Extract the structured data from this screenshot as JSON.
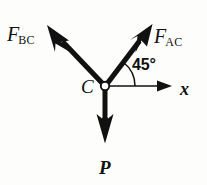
{
  "figure": {
    "type": "free-body-diagram",
    "background_color": "#fdfdfb",
    "stroke_color": "#111111",
    "width": 207,
    "height": 185
  },
  "node": {
    "label": "C",
    "name": "joint-c",
    "x": 105,
    "y": 86,
    "radius": 4.2,
    "fill": "#ffffff",
    "stroke": "#111111"
  },
  "axis": {
    "label": "x",
    "name": "x-axis",
    "from": [
      105,
      86
    ],
    "to": [
      172,
      86
    ],
    "style": "thin-line-with-solid-arrowhead"
  },
  "angle": {
    "value": "45°",
    "degrees": 45,
    "between": [
      "x-axis",
      "F_AC"
    ],
    "arc_radius": 30
  },
  "vectors": [
    {
      "id": "F_BC",
      "base": "F",
      "subscript": "BC",
      "name": "force-vector-fbc",
      "from": [
        105,
        86
      ],
      "to": [
        48,
        26
      ],
      "direction_deg": 135,
      "style": "bold-barbed-arrow"
    },
    {
      "id": "F_AC",
      "base": "F",
      "subscript": "AC",
      "name": "force-vector-fac",
      "from": [
        105,
        86
      ],
      "to": [
        152,
        25
      ],
      "direction_deg": 52,
      "style": "bold-barbed-arrow"
    },
    {
      "id": "P",
      "base": "P",
      "subscript": "",
      "name": "force-vector-p",
      "from": [
        105,
        86
      ],
      "to": [
        105,
        143
      ],
      "direction_deg": 270,
      "style": "bold-barbed-arrow"
    }
  ]
}
